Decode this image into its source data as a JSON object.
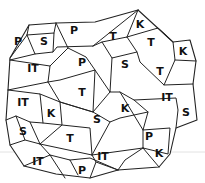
{
  "diagram": {
    "type": "region-partition-map",
    "regions": [
      {
        "label": "P",
        "x": 18,
        "y": 42
      },
      {
        "label": "S",
        "x": 44,
        "y": 42
      },
      {
        "label": "P",
        "x": 74,
        "y": 31
      },
      {
        "label": "T",
        "x": 113,
        "y": 37
      },
      {
        "label": "K",
        "x": 140,
        "y": 25
      },
      {
        "label": "IT",
        "x": 33,
        "y": 69
      },
      {
        "label": "P",
        "x": 82,
        "y": 63
      },
      {
        "label": "S",
        "x": 125,
        "y": 65
      },
      {
        "label": "T",
        "x": 151,
        "y": 43
      },
      {
        "label": "K",
        "x": 183,
        "y": 52
      },
      {
        "label": "T",
        "x": 160,
        "y": 72
      },
      {
        "label": "T",
        "x": 82,
        "y": 93
      },
      {
        "label": "IT",
        "x": 23,
        "y": 103
      },
      {
        "label": "K",
        "x": 51,
        "y": 114
      },
      {
        "label": "S",
        "x": 97,
        "y": 120
      },
      {
        "label": "K",
        "x": 125,
        "y": 109
      },
      {
        "label": "IT",
        "x": 167,
        "y": 98
      },
      {
        "label": "S",
        "x": 186,
        "y": 113
      },
      {
        "label": "S",
        "x": 23,
        "y": 132
      },
      {
        "label": "T",
        "x": 70,
        "y": 139
      },
      {
        "label": "P",
        "x": 149,
        "y": 137
      },
      {
        "label": "IT",
        "x": 38,
        "y": 162
      },
      {
        "label": "IT",
        "x": 103,
        "y": 157
      },
      {
        "label": "P",
        "x": 82,
        "y": 171
      },
      {
        "label": "K",
        "x": 159,
        "y": 154
      }
    ]
  }
}
